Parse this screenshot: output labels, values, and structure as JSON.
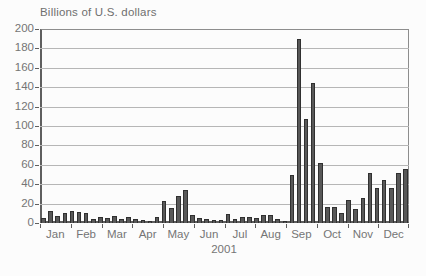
{
  "title": "Billions of U.S. dollars",
  "colors": {
    "bar_fill": "#585858",
    "bar_border": "#303030",
    "grid": "#b6b6b6",
    "frame": "#8d8d8d",
    "axis": "#5f5f5f",
    "text": "#757575",
    "background": "#fcfcfc"
  },
  "chart_data": {
    "type": "bar",
    "title": "Billions of U.S. dollars",
    "year_label": "2001",
    "frequency": "weekly",
    "x_tick_labels": [
      "Jan",
      "Feb",
      "Mar",
      "Apr",
      "May",
      "Jun",
      "Jul",
      "Aug",
      "Sep",
      "Oct",
      "Nov",
      "Dec"
    ],
    "y_ticks": [
      0,
      20,
      40,
      60,
      80,
      100,
      120,
      140,
      160,
      180,
      200
    ],
    "ylim": [
      0,
      200
    ],
    "grid": true,
    "values": [
      5,
      12,
      7,
      10,
      12,
      11,
      10,
      4,
      6,
      5,
      7,
      4,
      6,
      4,
      3,
      2,
      6,
      23,
      15,
      28,
      34,
      8,
      5,
      4,
      3,
      3,
      9,
      4,
      6,
      6,
      5,
      8,
      8,
      4,
      2,
      50,
      190,
      107,
      144,
      62,
      17,
      17,
      10,
      24,
      14,
      26,
      52,
      36,
      44,
      36,
      52,
      56
    ]
  }
}
